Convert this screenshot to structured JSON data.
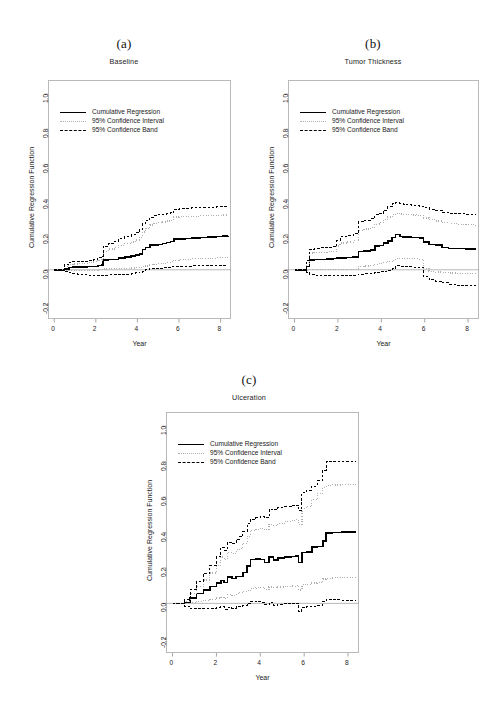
{
  "figure": {
    "axis": {
      "xlabel": "Year",
      "ylabel": "Cumulative Regression Function",
      "xticks": [
        "0",
        "2",
        "4",
        "6",
        "8"
      ],
      "xtick_values": [
        0,
        2,
        4,
        6,
        8
      ],
      "yticks": [
        "-0.2",
        "0.0",
        "0.2",
        "0.4",
        "0.6",
        "0.8",
        "1.0"
      ],
      "ytick_values": [
        -0.2,
        0.0,
        0.2,
        0.4,
        0.6,
        0.8,
        1.0
      ],
      "xlim": [
        -0.3,
        8.5
      ],
      "ylim": [
        -0.28,
        1.08
      ]
    },
    "legend": [
      {
        "label": "Cumulative Regression",
        "style": "solid",
        "color": "#000000"
      },
      {
        "label": "95% Confidence Interval",
        "style": "dotted",
        "color": "#b0b0b0"
      },
      {
        "label": "95% Confidence Band",
        "style": "dashed",
        "color": "#000000"
      }
    ]
  },
  "chart_data": [
    {
      "type": "line",
      "panel": "(a)",
      "title": "Baseline",
      "xlabel": "Year",
      "ylabel": "Cumulative Regression Function",
      "xlim": [
        -0.3,
        8.5
      ],
      "ylim": [
        -0.28,
        1.08
      ],
      "grid": false,
      "legend_position": "upper left",
      "x": [
        0,
        0.3,
        0.5,
        0.7,
        0.9,
        1.1,
        1.3,
        1.6,
        1.9,
        2.1,
        2.3,
        2.35,
        2.6,
        2.9,
        3.1,
        3.4,
        3.7,
        3.9,
        4.1,
        4.25,
        4.4,
        4.6,
        4.8,
        5.0,
        5.2,
        5.4,
        5.6,
        5.75,
        6.0,
        6.3,
        6.6,
        7.0,
        7.4,
        7.8,
        8.1,
        8.35
      ],
      "series": [
        {
          "name": "Cumulative Regression",
          "style": "solid",
          "color": "#000000",
          "values": [
            0.0,
            0.0,
            0.005,
            0.013,
            0.015,
            0.015,
            0.016,
            0.018,
            0.02,
            0.025,
            0.028,
            0.055,
            0.058,
            0.06,
            0.068,
            0.072,
            0.078,
            0.085,
            0.09,
            0.115,
            0.128,
            0.14,
            0.142,
            0.145,
            0.15,
            0.156,
            0.162,
            0.175,
            0.176,
            0.178,
            0.18,
            0.183,
            0.186,
            0.19,
            0.192,
            0.193
          ]
        },
        {
          "name": "95% Confidence Interval upper",
          "style": "dotted",
          "color": "#b0b0b0",
          "values": [
            0.0,
            0.0,
            0.018,
            0.03,
            0.033,
            0.034,
            0.036,
            0.04,
            0.045,
            0.055,
            0.062,
            0.105,
            0.118,
            0.128,
            0.14,
            0.148,
            0.158,
            0.17,
            0.185,
            0.215,
            0.235,
            0.255,
            0.262,
            0.268,
            0.272,
            0.278,
            0.282,
            0.3,
            0.302,
            0.303,
            0.305,
            0.307,
            0.309,
            0.31,
            0.312,
            0.313
          ]
        },
        {
          "name": "95% Confidence Interval lower",
          "style": "dotted",
          "color": "#b0b0b0",
          "values": [
            0.0,
            0.0,
            -0.005,
            -0.003,
            -0.002,
            -0.002,
            -0.002,
            -0.002,
            -0.002,
            0.0,
            0.0,
            0.005,
            0.006,
            0.007,
            0.008,
            0.009,
            0.01,
            0.012,
            0.014,
            0.018,
            0.022,
            0.028,
            0.031,
            0.034,
            0.038,
            0.042,
            0.046,
            0.055,
            0.058,
            0.06,
            0.062,
            0.064,
            0.066,
            0.068,
            0.07,
            0.07
          ]
        },
        {
          "name": "95% Confidence Band upper",
          "style": "dashed",
          "color": "#000000",
          "values": [
            0.0,
            0.0,
            0.028,
            0.042,
            0.045,
            0.046,
            0.048,
            0.053,
            0.058,
            0.07,
            0.078,
            0.135,
            0.15,
            0.162,
            0.178,
            0.188,
            0.198,
            0.21,
            0.228,
            0.262,
            0.282,
            0.3,
            0.308,
            0.312,
            0.316,
            0.32,
            0.324,
            0.345,
            0.348,
            0.35,
            0.352,
            0.354,
            0.356,
            0.358,
            0.36,
            0.361
          ]
        },
        {
          "name": "95% Confidence Band lower",
          "style": "dashed",
          "color": "#000000",
          "values": [
            0.0,
            0.0,
            -0.012,
            -0.018,
            -0.022,
            -0.025,
            -0.027,
            -0.03,
            -0.032,
            -0.032,
            -0.032,
            -0.03,
            -0.029,
            -0.028,
            -0.026,
            -0.024,
            -0.021,
            -0.018,
            -0.014,
            -0.008,
            -0.001,
            0.005,
            0.008,
            0.01,
            0.012,
            0.014,
            0.016,
            0.018,
            0.02,
            0.021,
            0.022,
            0.023,
            0.024,
            0.025,
            0.026,
            0.027
          ]
        }
      ]
    },
    {
      "type": "line",
      "panel": "(b)",
      "title": "Tumor Thickness",
      "xlabel": "Year",
      "ylabel": "Cumulative Regression Function",
      "xlim": [
        -0.3,
        8.5
      ],
      "ylim": [
        -0.28,
        1.08
      ],
      "grid": false,
      "legend_position": "upper left",
      "x": [
        0,
        0.4,
        0.55,
        0.7,
        0.9,
        1.2,
        1.5,
        1.8,
        1.95,
        2.1,
        2.4,
        2.7,
        2.9,
        2.95,
        3.2,
        3.5,
        3.7,
        3.9,
        4.1,
        4.3,
        4.5,
        4.65,
        4.85,
        5.0,
        5.2,
        5.4,
        5.6,
        5.75,
        5.95,
        6.2,
        6.5,
        6.8,
        7.1,
        7.5,
        7.9,
        8.35
      ],
      "series": [
        {
          "name": "Cumulative Regression",
          "style": "solid",
          "color": "#000000",
          "values": [
            0.0,
            0.0,
            0.018,
            0.055,
            0.058,
            0.06,
            0.062,
            0.064,
            0.066,
            0.068,
            0.07,
            0.072,
            0.074,
            0.105,
            0.108,
            0.112,
            0.135,
            0.138,
            0.152,
            0.165,
            0.185,
            0.2,
            0.19,
            0.188,
            0.186,
            0.185,
            0.184,
            0.182,
            0.158,
            0.145,
            0.142,
            0.128,
            0.122,
            0.12,
            0.118,
            0.115
          ]
        },
        {
          "name": "95% Confidence Interval upper",
          "style": "dotted",
          "color": "#b0b0b0",
          "values": [
            0.0,
            0.0,
            0.038,
            0.095,
            0.098,
            0.1,
            0.102,
            0.105,
            0.135,
            0.152,
            0.158,
            0.165,
            0.17,
            0.225,
            0.232,
            0.24,
            0.26,
            0.268,
            0.285,
            0.3,
            0.315,
            0.322,
            0.318,
            0.315,
            0.313,
            0.312,
            0.31,
            0.308,
            0.295,
            0.285,
            0.278,
            0.268,
            0.262,
            0.258,
            0.256,
            0.252
          ]
        },
        {
          "name": "95% Confidence Interval lower",
          "style": "dotted",
          "color": "#b0b0b0",
          "values": [
            0.0,
            0.0,
            -0.002,
            0.0,
            0.0,
            0.0,
            0.0,
            0.0,
            0.0,
            0.0,
            0.0,
            0.002,
            0.004,
            0.02,
            0.022,
            0.024,
            0.03,
            0.035,
            0.04,
            0.048,
            0.055,
            0.065,
            0.064,
            0.063,
            0.062,
            0.062,
            0.062,
            0.06,
            0.008,
            -0.008,
            -0.012,
            -0.015,
            -0.018,
            -0.02,
            -0.022,
            -0.025
          ]
        },
        {
          "name": "95% Confidence Band upper",
          "style": "dashed",
          "color": "#000000",
          "values": [
            0.0,
            0.0,
            0.052,
            0.118,
            0.122,
            0.125,
            0.128,
            0.132,
            0.168,
            0.188,
            0.195,
            0.205,
            0.21,
            0.272,
            0.282,
            0.29,
            0.312,
            0.32,
            0.34,
            0.358,
            0.375,
            0.382,
            0.378,
            0.374,
            0.37,
            0.368,
            0.366,
            0.362,
            0.352,
            0.345,
            0.338,
            0.328,
            0.322,
            0.318,
            0.315,
            0.312
          ]
        },
        {
          "name": "95% Confidence Band lower",
          "style": "dashed",
          "color": "#000000",
          "values": [
            0.0,
            0.0,
            -0.015,
            -0.028,
            -0.03,
            -0.032,
            -0.034,
            -0.035,
            -0.035,
            -0.034,
            -0.032,
            -0.03,
            -0.028,
            -0.024,
            -0.022,
            -0.02,
            -0.016,
            -0.012,
            -0.008,
            -0.002,
            0.005,
            0.022,
            0.02,
            0.018,
            0.016,
            0.015,
            0.014,
            0.012,
            -0.04,
            -0.058,
            -0.065,
            -0.075,
            -0.082,
            -0.088,
            -0.092,
            -0.095
          ]
        }
      ]
    },
    {
      "type": "line",
      "panel": "(c)",
      "title": "Ulceration",
      "xlabel": "Year",
      "ylabel": "Cumulative Regression Function",
      "xlim": [
        -0.3,
        8.5
      ],
      "ylim": [
        -0.28,
        1.08
      ],
      "grid": false,
      "legend_position": "upper left",
      "x": [
        0,
        0.4,
        0.55,
        0.8,
        1.1,
        1.4,
        1.7,
        2.0,
        2.2,
        2.35,
        2.5,
        2.7,
        2.9,
        3.05,
        3.2,
        3.4,
        3.55,
        3.8,
        4.0,
        4.2,
        4.4,
        4.6,
        4.8,
        5.1,
        5.4,
        5.6,
        5.75,
        5.9,
        6.1,
        6.35,
        6.6,
        6.85,
        7.0,
        7.3,
        7.7,
        8.35
      ],
      "series": [
        {
          "name": "Cumulative Regression",
          "style": "solid",
          "color": "#000000",
          "values": [
            0.0,
            0.0,
            0.005,
            0.03,
            0.055,
            0.075,
            0.095,
            0.115,
            0.13,
            0.118,
            0.148,
            0.14,
            0.152,
            0.152,
            0.175,
            0.21,
            0.248,
            0.25,
            0.248,
            0.232,
            0.262,
            0.245,
            0.255,
            0.262,
            0.265,
            0.268,
            0.232,
            0.288,
            0.29,
            0.318,
            0.322,
            0.352,
            0.398,
            0.4,
            0.402,
            0.405
          ]
        },
        {
          "name": "95% Confidence Interval upper",
          "style": "dotted",
          "color": "#b0b0b0",
          "values": [
            0.0,
            0.0,
            0.012,
            0.055,
            0.095,
            0.132,
            0.172,
            0.212,
            0.262,
            0.248,
            0.288,
            0.282,
            0.302,
            0.31,
            0.34,
            0.378,
            0.412,
            0.418,
            0.422,
            0.415,
            0.445,
            0.44,
            0.45,
            0.462,
            0.468,
            0.472,
            0.445,
            0.535,
            0.545,
            0.585,
            0.62,
            0.655,
            0.665,
            0.668,
            0.67,
            0.67
          ]
        },
        {
          "name": "95% Confidence Interval lower",
          "style": "dotted",
          "color": "#b0b0b0",
          "values": [
            0.0,
            0.0,
            -0.002,
            0.004,
            0.012,
            0.018,
            0.022,
            0.03,
            0.032,
            0.028,
            0.048,
            0.045,
            0.055,
            0.06,
            0.068,
            0.072,
            0.085,
            0.088,
            0.09,
            0.078,
            0.092,
            0.088,
            0.092,
            0.095,
            0.098,
            0.1,
            0.075,
            0.105,
            0.108,
            0.115,
            0.118,
            0.138,
            0.142,
            0.145,
            0.148,
            0.148
          ]
        },
        {
          "name": "95% Confidence Band upper",
          "style": "dashed",
          "color": "#000000",
          "values": [
            0.0,
            0.0,
            0.02,
            0.078,
            0.125,
            0.168,
            0.212,
            0.262,
            0.315,
            0.3,
            0.345,
            0.338,
            0.362,
            0.375,
            0.405,
            0.448,
            0.475,
            0.482,
            0.488,
            0.482,
            0.532,
            0.528,
            0.542,
            0.548,
            0.552,
            0.555,
            0.522,
            0.625,
            0.638,
            0.662,
            0.692,
            0.752,
            0.798,
            0.8,
            0.802,
            0.802
          ]
        },
        {
          "name": "95% Confidence Band lower",
          "style": "dashed",
          "color": "#000000",
          "values": [
            0.0,
            0.0,
            -0.015,
            -0.028,
            -0.03,
            -0.03,
            -0.028,
            -0.025,
            -0.02,
            -0.032,
            -0.022,
            -0.028,
            -0.02,
            -0.018,
            -0.012,
            0.0,
            0.012,
            0.008,
            0.005,
            -0.008,
            0.006,
            -0.01,
            -0.006,
            -0.002,
            0.0,
            0.002,
            -0.045,
            -0.025,
            -0.02,
            -0.015,
            -0.01,
            0.012,
            0.022,
            0.02,
            0.018,
            0.015
          ]
        }
      ]
    }
  ]
}
